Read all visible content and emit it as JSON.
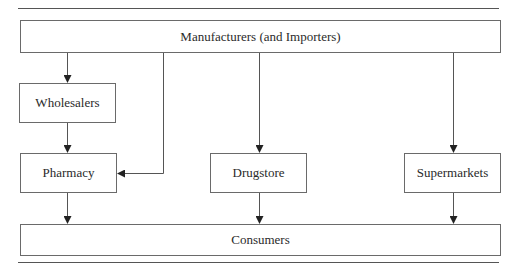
{
  "diagram": {
    "title": "",
    "nodes": {
      "manufacturers": "Manufacturers (and Importers)",
      "wholesalers": "Wholesalers",
      "pharmacy": "Pharmacy",
      "drugstore": "Drugstore",
      "supermarkets": "Supermarkets",
      "consumers": "Consumers"
    },
    "edges": [
      {
        "from": "Manufacturers (and Importers)",
        "to": "Wholesalers"
      },
      {
        "from": "Manufacturers (and Importers)",
        "to": "Pharmacy"
      },
      {
        "from": "Manufacturers (and Importers)",
        "to": "Drugstore"
      },
      {
        "from": "Manufacturers (and Importers)",
        "to": "Supermarkets"
      },
      {
        "from": "Wholesalers",
        "to": "Pharmacy"
      },
      {
        "from": "Pharmacy",
        "to": "Consumers"
      },
      {
        "from": "Drugstore",
        "to": "Consumers"
      },
      {
        "from": "Supermarkets",
        "to": "Consumers"
      }
    ],
    "colors": {
      "line": "#555555",
      "box_border": "#6a6a6a",
      "text": "#2a2a2a",
      "background": "#ffffff"
    }
  }
}
